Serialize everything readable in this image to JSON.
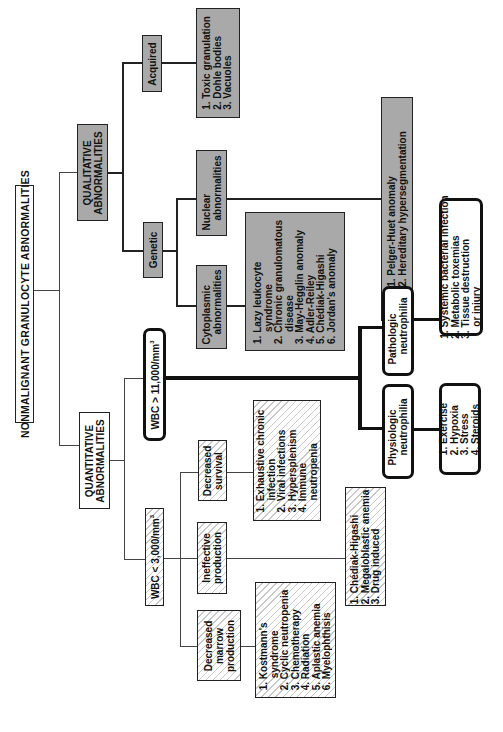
{
  "root": {
    "title": "NONMALIGNANT GRANULOCYTE ABNORMALITIES"
  },
  "qualitative": {
    "title_line1": "QUALITATIVE",
    "title_line2": "ABNORMALITIES",
    "acquired": {
      "label": "Acquired",
      "items": [
        "1. Toxic granulation",
        "2. Dohle bodies",
        "3. Vacuoles"
      ]
    },
    "genetic": {
      "label": "Genetic",
      "nuclear": {
        "label_line1": "Nuclear",
        "label_line2": "abnormalities",
        "items": [
          "1. Pelger-Huet anomaly",
          "2. Hereditary hypersegmentation"
        ]
      },
      "cytoplasmic": {
        "label_line1": "Cytoplasmic",
        "label_line2": "abnormalities",
        "items": [
          "1. Lazy leukocyte",
          "syndrome",
          "2. Chronic granulomatous",
          "disease",
          "3. May-Hegglin anomaly",
          "4. Adler-Reiley",
          "5. Chédiak-Higashi",
          "6. Jordan's anomaly"
        ]
      }
    }
  },
  "quantitative": {
    "title_line1": "QUANTITATIVE",
    "title_line2": "ABNORMALITIES",
    "high": {
      "label": "WBC > 11,000/mm",
      "label_sup": "3",
      "physiologic": {
        "label_line1": "Physiologic",
        "label_line2": "neutrophilia",
        "items": [
          "1. Exercise",
          "2. Hypoxia",
          "3. Stress",
          "4. Steroids"
        ]
      },
      "pathologic": {
        "label_line1": "Pathologic",
        "label_line2": "neutrophilia",
        "items": [
          "1. Systemic bacterial infection",
          "2. Metabolic toxemias",
          "3. Tissue destruction",
          "or injury"
        ]
      }
    },
    "low": {
      "label": "WBC < 3,000/mm",
      "label_sup": "3",
      "decreased_survival": {
        "label_line1": "Decreased",
        "label_line2": "survival",
        "items": [
          "1. Exhaustive chronic",
          "infection",
          "2. Viral infections",
          "3. Hypersplenism",
          "4. Immune",
          "neutropenia"
        ]
      },
      "ineffective_production": {
        "label_line1": "Ineffective",
        "label_line2": "production",
        "items": [
          "1. Chédiak-Higashi",
          "2. Megaloblastic anemia",
          "3. Drug induced"
        ]
      },
      "decreased_marrow": {
        "label_line1": "Decreased",
        "label_line2": "marrow",
        "label_line3": "production",
        "items": [
          "1. Kostmann's",
          "syndrome",
          "2. Cyclic neutropenia",
          "3. Chemotherapy",
          "4. Radiation",
          "5. Aplastic anemia",
          "6. Myelophthisis"
        ]
      }
    }
  }
}
